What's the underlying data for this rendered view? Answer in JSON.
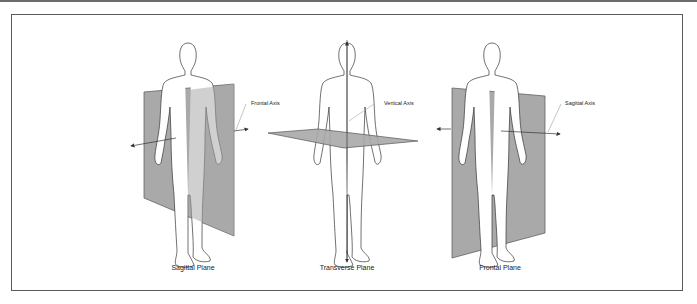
{
  "figure": {
    "panels": [
      {
        "id": "sagittal",
        "caption": "Sagittal Plane",
        "axis_label": "Frontal Axis"
      },
      {
        "id": "transverse",
        "caption": "Transverse Plane",
        "axis_label": "Vertical Axis"
      },
      {
        "id": "frontal",
        "caption": "Frontal Plane",
        "axis_label": "Sagittal Axis"
      }
    ],
    "colors": {
      "plane_fill": "#a9a9a9",
      "plane_edge": "#555555",
      "figure_outline": "#333333",
      "frame_border": "#5a5a5a"
    }
  }
}
